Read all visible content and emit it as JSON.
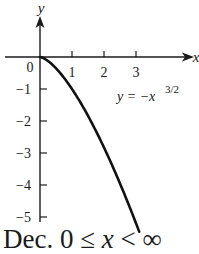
{
  "chart_data": {
    "type": "line",
    "title": "",
    "xlabel": "x",
    "ylabel": "y",
    "x_ticks": [
      "0",
      "1",
      "2",
      "3"
    ],
    "y_ticks": [
      "−1",
      "−2",
      "−3",
      "−4",
      "−5"
    ],
    "xlim": [
      0,
      4.8
    ],
    "ylim": [
      -5.6,
      1.2
    ],
    "grid": false,
    "series": [
      {
        "name": "y = -x^(3/2)",
        "x": [
          0,
          0.25,
          0.5,
          0.75,
          1,
          1.25,
          1.5,
          1.75,
          2,
          2.25,
          2.5,
          2.75,
          3,
          3.1
        ],
        "values": [
          0,
          -0.125,
          -0.354,
          -0.65,
          -1,
          -1.398,
          -1.837,
          -2.315,
          -2.828,
          -3.375,
          -3.953,
          -4.56,
          -5.196,
          -5.458
        ]
      }
    ],
    "annotations": [
      {
        "text": "y = −x",
        "superscript": "3/2",
        "x": 2.3,
        "y": -1.2
      }
    ]
  },
  "labels": {
    "origin": "0",
    "x_axis": "x",
    "y_axis": "y",
    "equation_base": "y = −x",
    "equation_exp": "3/2"
  },
  "caption": {
    "prefix": "Dec. 0 ≤ ",
    "var": "x",
    "suffix": " < ∞"
  },
  "colors": {
    "axis": "#1a1a1a",
    "curve": "#111111",
    "background": "#ffffff"
  }
}
